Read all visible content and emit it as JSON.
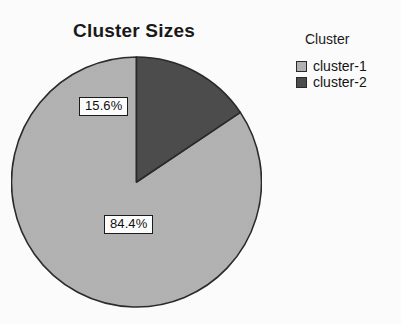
{
  "chart_data": {
    "type": "pie",
    "title": "Cluster Sizes",
    "categories": [
      "cluster-1",
      "cluster-2"
    ],
    "values": [
      84.4,
      15.6
    ],
    "value_labels": [
      "84.4%",
      "15.6%"
    ],
    "colors": [
      "#b3b3b3",
      "#4d4d4d"
    ],
    "legend_title": "Cluster",
    "legend_position": "right",
    "start_angle_deg": 90,
    "direction": "counterclockwise",
    "grid": false,
    "xlabel": "",
    "ylabel": ""
  },
  "chart": {
    "title": "Cluster Sizes",
    "slices": [
      {
        "name": "cluster-1",
        "percent_label": "84.4%",
        "value": 84.4,
        "color": "#b3b3b3"
      },
      {
        "name": "cluster-2",
        "percent_label": "15.6%",
        "value": 15.6,
        "color": "#4d4d4d"
      }
    ]
  },
  "legend": {
    "title": "Cluster",
    "items": [
      {
        "label": "cluster-1",
        "color": "#b3b3b3"
      },
      {
        "label": "cluster-2",
        "color": "#4d4d4d"
      }
    ]
  }
}
